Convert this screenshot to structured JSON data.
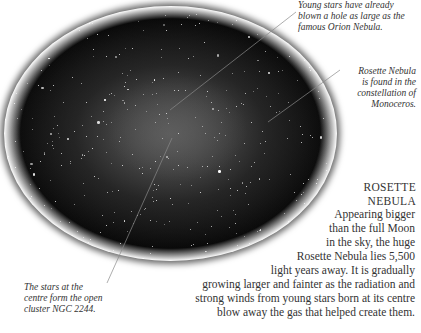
{
  "image": {
    "subject": "Rosette Nebula photograph",
    "shape": "oval vignette"
  },
  "captions": {
    "top_right": [
      "Young stars have already",
      "blown a hole as large as the",
      "famous Orion Nebula."
    ],
    "right": [
      "Rosette Nebula",
      "is found in the",
      "constellation of",
      "Monoceros."
    ],
    "bottom_left": [
      "The stars at the",
      "centre form the open",
      "cluster NGC 2244."
    ]
  },
  "article": {
    "title_lines": [
      "ROSETTE",
      "NEBULA"
    ],
    "body_lines": [
      "Appearing bigger",
      "than the full Moon",
      "in the sky, the huge",
      "Rosette Nebula lies 5,500",
      "light years away. It is gradually",
      "growing larger and fainter as the radiation and",
      "strong winds from young stars born at its centre",
      "blow away the gas that helped create them."
    ]
  },
  "colors": {
    "text": "#333333",
    "leader_line": "#888888",
    "background": "#ffffff"
  }
}
